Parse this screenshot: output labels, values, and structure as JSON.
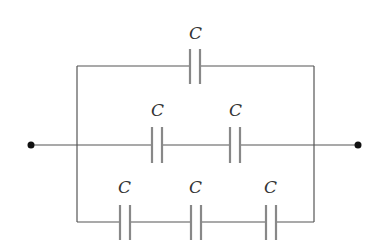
{
  "diagram": {
    "type": "capacitor-network",
    "colors": {
      "wire": "#555555",
      "plate": "#888888",
      "text": "#333333",
      "terminal": "#111111"
    },
    "terminals": [
      {
        "id": "left-terminal",
        "x": 31,
        "y": 145
      },
      {
        "id": "right-terminal",
        "x": 358,
        "y": 145
      }
    ],
    "branches": [
      {
        "name": "top-branch",
        "capacitors": [
          {
            "label": "C",
            "x": 195
          }
        ]
      },
      {
        "name": "middle-branch",
        "capacitors": [
          {
            "label": "C",
            "x": 157
          },
          {
            "label": "C",
            "x": 235
          }
        ]
      },
      {
        "name": "bottom-branch",
        "capacitors": [
          {
            "label": "C",
            "x": 125
          },
          {
            "label": "C",
            "x": 196
          },
          {
            "label": "C",
            "x": 271
          }
        ]
      }
    ]
  }
}
